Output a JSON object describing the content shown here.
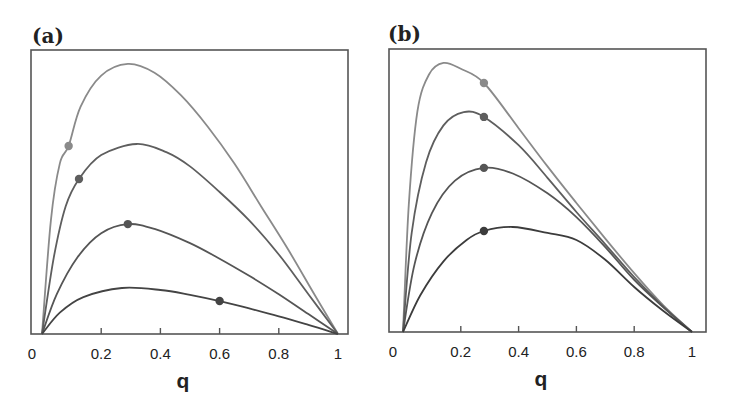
{
  "chart_data": [
    {
      "type": "line",
      "panel_label": "(a)",
      "title": "",
      "xlabel": "q",
      "ylabel": "",
      "xlim": [
        0,
        1
      ],
      "ylim": [
        0,
        100
      ],
      "xticks": [
        0,
        0.2,
        0.4,
        0.6,
        0.8,
        1
      ],
      "xtick_labels": [
        "0",
        "0.2",
        "0.4",
        "0.6",
        "0.8",
        "1"
      ],
      "grid": false,
      "legend": null,
      "series": [
        {
          "name": "curve-1",
          "color": "#8a8a8a",
          "points": [
            [
              0,
              0
            ],
            [
              0.03,
              40
            ],
            [
              0.06,
              60
            ],
            [
              0.09,
              66.2
            ],
            [
              0.13,
              80
            ],
            [
              0.2,
              91
            ],
            [
              0.29,
              95.1
            ],
            [
              0.38,
              92
            ],
            [
              0.47,
              84
            ],
            [
              0.56,
              73
            ],
            [
              0.65,
              60
            ],
            [
              0.74,
              45
            ],
            [
              0.83,
              30
            ],
            [
              0.92,
              14
            ],
            [
              1,
              0
            ]
          ],
          "marker": [
            0.09,
            66.2
          ]
        },
        {
          "name": "curve-2",
          "color": "#5e5e5e",
          "points": [
            [
              0,
              0
            ],
            [
              0.04,
              27
            ],
            [
              0.08,
              45
            ],
            [
              0.125,
              54.6
            ],
            [
              0.2,
              63
            ],
            [
              0.32,
              66.9
            ],
            [
              0.42,
              64
            ],
            [
              0.5,
              59
            ],
            [
              0.6,
              50
            ],
            [
              0.7,
              40
            ],
            [
              0.8,
              28
            ],
            [
              0.9,
              14
            ],
            [
              1,
              0
            ]
          ],
          "marker": [
            0.125,
            54.6
          ]
        },
        {
          "name": "curve-3",
          "color": "#555555",
          "points": [
            [
              0,
              0
            ],
            [
              0.05,
              14
            ],
            [
              0.12,
              27
            ],
            [
              0.2,
              35.5
            ],
            [
              0.29,
              38.7
            ],
            [
              0.38,
              37
            ],
            [
              0.5,
              32
            ],
            [
              0.6,
              26.5
            ],
            [
              0.7,
              20.5
            ],
            [
              0.8,
              14
            ],
            [
              0.9,
              7
            ],
            [
              1,
              0
            ]
          ],
          "marker": [
            0.29,
            38.7
          ]
        },
        {
          "name": "curve-4",
          "color": "#444444",
          "points": [
            [
              0,
              0
            ],
            [
              0.06,
              7.5
            ],
            [
              0.14,
              13
            ],
            [
              0.27,
              16.2
            ],
            [
              0.4,
              15.5
            ],
            [
              0.5,
              13.8
            ],
            [
              0.6,
              11.6
            ],
            [
              0.7,
              9
            ],
            [
              0.8,
              6.2
            ],
            [
              0.9,
              3.2
            ],
            [
              1,
              0
            ]
          ],
          "marker": [
            0.6,
            11.6
          ]
        }
      ]
    },
    {
      "type": "line",
      "panel_label": "(b)",
      "title": "",
      "xlabel": "q",
      "ylabel": "",
      "xlim": [
        0,
        1
      ],
      "ylim": [
        0,
        100
      ],
      "xticks": [
        0,
        0.2,
        0.4,
        0.6,
        0.8,
        1
      ],
      "xtick_labels": [
        "0",
        "0.2",
        "0.4",
        "0.6",
        "0.8",
        "1"
      ],
      "grid": false,
      "legend": null,
      "series": [
        {
          "name": "curve-1",
          "color": "#8a8a8a",
          "points": [
            [
              0,
              0
            ],
            [
              0.02,
              45
            ],
            [
              0.05,
              78
            ],
            [
              0.09,
              91
            ],
            [
              0.14,
              95.1
            ],
            [
              0.2,
              93
            ],
            [
              0.28,
              88
            ],
            [
              0.4,
              72
            ],
            [
              0.5,
              58.5
            ],
            [
              0.6,
              45.6
            ],
            [
              0.7,
              33
            ],
            [
              0.8,
              20.8
            ],
            [
              0.9,
              9.5
            ],
            [
              1,
              0
            ]
          ],
          "marker": [
            0.28,
            88.0
          ]
        },
        {
          "name": "curve-2",
          "color": "#5e5e5e",
          "points": [
            [
              0,
              0
            ],
            [
              0.03,
              35
            ],
            [
              0.08,
              60
            ],
            [
              0.14,
              73
            ],
            [
              0.21,
              77.7
            ],
            [
              0.28,
              76
            ],
            [
              0.4,
              66
            ],
            [
              0.5,
              54.5
            ],
            [
              0.6,
              42.4
            ],
            [
              0.7,
              31
            ],
            [
              0.8,
              19.4
            ],
            [
              0.9,
              9
            ],
            [
              1,
              0
            ]
          ],
          "marker": [
            0.28,
            76.0
          ]
        },
        {
          "name": "curve-3",
          "color": "#555555",
          "points": [
            [
              0,
              0
            ],
            [
              0.04,
              24
            ],
            [
              0.1,
              42
            ],
            [
              0.18,
              53.5
            ],
            [
              0.28,
              58
            ],
            [
              0.38,
              56
            ],
            [
              0.5,
              49
            ],
            [
              0.6,
              40.6
            ],
            [
              0.7,
              30
            ],
            [
              0.8,
              18.4
            ],
            [
              0.9,
              8.8
            ],
            [
              1,
              0
            ]
          ],
          "marker": [
            0.28,
            58.0
          ]
        },
        {
          "name": "curve-4",
          "color": "#3c3c3c",
          "points": [
            [
              0,
              0
            ],
            [
              0.06,
              13
            ],
            [
              0.14,
              25
            ],
            [
              0.22,
              32.5
            ],
            [
              0.28,
              35.7
            ],
            [
              0.38,
              37.1
            ],
            [
              0.5,
              35
            ],
            [
              0.6,
              32.5
            ],
            [
              0.7,
              25.5
            ],
            [
              0.8,
              15.9
            ],
            [
              0.9,
              7.5
            ],
            [
              1,
              0
            ]
          ],
          "marker": [
            0.28,
            35.7
          ]
        }
      ]
    }
  ],
  "panels": [
    {
      "label": "(a)",
      "xlabel": "q"
    },
    {
      "label": "(b)",
      "xlabel": "q"
    }
  ]
}
